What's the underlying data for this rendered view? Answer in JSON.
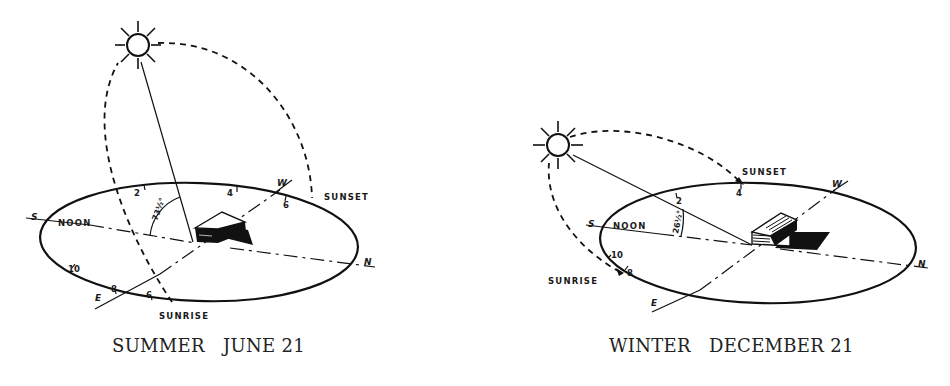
{
  "figure": {
    "panels": [
      {
        "id": "summer",
        "caption": "SUMMER   JUNE 21",
        "season": "SUMMER",
        "date": "JUNE 21",
        "noon_altitude_label": "73½°",
        "labels": {
          "noon": "NOON",
          "sunset": "SUNSET",
          "sunrise": "SUNRISE"
        },
        "directions": {
          "south": "S",
          "north": "N",
          "east": "E",
          "west": "W"
        },
        "hour_marks": [
          "2",
          "4",
          "6",
          "8",
          "10",
          "6"
        ]
      },
      {
        "id": "winter",
        "caption": "WINTER   DECEMBER 21",
        "season": "WINTER",
        "date": "DECEMBER 21",
        "noon_altitude_label": "26½°",
        "labels": {
          "noon": "NOON",
          "sunset": "SUNSET",
          "sunrise": "SUNRISE"
        },
        "directions": {
          "south": "S",
          "north": "N",
          "east": "E",
          "west": "W"
        },
        "hour_marks": [
          "2",
          "4",
          "8",
          "10"
        ]
      }
    ],
    "colors": {
      "ink": "#111111",
      "paper": "#ffffff"
    }
  }
}
